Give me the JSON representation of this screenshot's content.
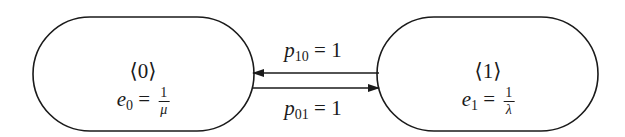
{
  "diagram": {
    "type": "state-transition",
    "states": [
      {
        "id": "0",
        "label": "⟨0⟩",
        "rate_var": "e",
        "rate_sub": "0",
        "rate_num": "1",
        "rate_den": "μ"
      },
      {
        "id": "1",
        "label": "⟨1⟩",
        "rate_var": "e",
        "rate_sub": "1",
        "rate_num": "1",
        "rate_den": "λ"
      }
    ],
    "transitions": [
      {
        "from": "1",
        "to": "0",
        "var": "p",
        "sub": "10",
        "value": "= 1"
      },
      {
        "from": "0",
        "to": "1",
        "var": "p",
        "sub": "01",
        "value": "= 1"
      }
    ],
    "colors": {
      "stroke": "#1a1a1a",
      "background": "#ffffff"
    }
  }
}
